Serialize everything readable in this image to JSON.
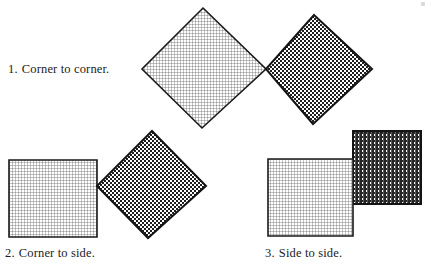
{
  "figure": {
    "title": "",
    "background_color": "#ffffff",
    "ink_color": "#1a1a1a",
    "light_fill_color": "#d9d9d9",
    "dark_fill_color": "#3c3c3c",
    "outline_color": "#1a1a1a",
    "panels": [
      {
        "id": "panel-1",
        "caption_number": "1.",
        "caption_text": "Corner to corner.",
        "arrangement": "corner-to-corner",
        "shapes": [
          {
            "name": "light-square-diamond",
            "fill": "light-hatch",
            "rotation_deg": 45,
            "points": "203,8 266,69 202,128 142,69"
          },
          {
            "name": "dark-square-diamond",
            "fill": "dark-checker",
            "rotation_deg": 42,
            "points": "314,15 372,69 313,124 266,69"
          }
        ]
      },
      {
        "id": "panel-2",
        "caption_number": "2.",
        "caption_text": "Corner to side.",
        "arrangement": "corner-to-side",
        "shapes": [
          {
            "name": "light-square-axis-aligned",
            "fill": "light-hatch",
            "rotation_deg": 0,
            "points": "9,160 97,160 97,237 9,237"
          },
          {
            "name": "dark-square-diamond",
            "fill": "dark-checker",
            "rotation_deg": 41,
            "points": "152,131 206,186 148,238 97,186"
          }
        ]
      },
      {
        "id": "panel-3",
        "caption_number": "3.",
        "caption_text": "Side to side.",
        "arrangement": "side-to-side",
        "shapes": [
          {
            "name": "light-square-axis-aligned",
            "fill": "light-hatch",
            "rotation_deg": 0,
            "points": "268,159 353,159 353,236 268,236"
          },
          {
            "name": "dark-square-axis-aligned",
            "fill": "dark-checker",
            "rotation_deg": 0,
            "points": "353,131 421,131 421,204 353,204"
          }
        ]
      }
    ]
  }
}
